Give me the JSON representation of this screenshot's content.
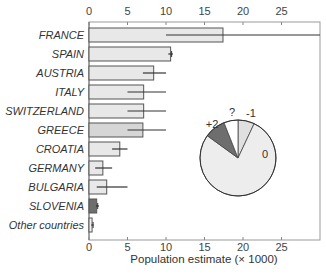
{
  "chart_data": [
    {
      "type": "bar",
      "orientation": "horizontal",
      "title": "",
      "xlabel": "Population estimate (× 1000)",
      "ylabel": "",
      "xlim": [
        0,
        30
      ],
      "xticks": [
        0,
        5,
        10,
        15,
        20,
        25
      ],
      "xtick_labels": [
        "0",
        "5",
        "10",
        "15",
        "20",
        "25"
      ],
      "axis_top_and_bottom": true,
      "grid": false,
      "categories": [
        "FRANCE",
        "SPAIN",
        "AUSTRIA",
        "ITALY",
        "SWITZERLAND",
        "GREECE",
        "CROATIA",
        "GERMANY",
        "BULGARIA",
        "SLOVENIA",
        "Other countries"
      ],
      "category_italic": true,
      "values": [
        17.4,
        10.6,
        8.4,
        7.1,
        7.1,
        7.0,
        4.0,
        1.8,
        2.3,
        1.0,
        0.4
      ],
      "error_low": [
        10,
        10.3,
        7,
        5,
        5,
        5,
        3,
        0.8,
        1,
        0.9,
        0.3
      ],
      "error_high": [
        30,
        10.9,
        10,
        10,
        10,
        10,
        5,
        3,
        5,
        1.3,
        0.6
      ],
      "bar_colors": [
        "#e8e8e8",
        "#e8e8e8",
        "#e8e8e8",
        "#e8e8e8",
        "#e8e8e8",
        "#d6d6d6",
        "#e8e8e8",
        "#e8e8e8",
        "#e8e8e8",
        "#6e6e6e",
        "#f2f2f2"
      ]
    },
    {
      "type": "pie",
      "title": "",
      "start_angle_deg": 0,
      "direction": "clockwise",
      "slices": [
        {
          "label": "-1",
          "value": 7,
          "color": "#e0e0e0"
        },
        {
          "label": "0",
          "value": 78,
          "color": "#ededed"
        },
        {
          "label": "+2",
          "value": 9,
          "color": "#6e6e6e"
        },
        {
          "label": "?",
          "value": 6,
          "color": "#ffffff"
        }
      ]
    }
  ],
  "axis": {
    "top_ticks": [
      "0",
      "5",
      "10",
      "15",
      "20",
      "25"
    ],
    "bottom_ticks": [
      "0",
      "5",
      "10",
      "15",
      "20",
      "25"
    ],
    "title": "Population estimate (× 1000)"
  },
  "pie_labels": [
    "-1",
    "0",
    "+2",
    "?"
  ]
}
